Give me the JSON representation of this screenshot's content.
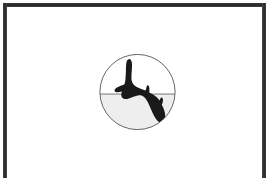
{
  "page": {
    "background_color": "#ffffff",
    "width": 269,
    "height": 178
  },
  "frame": {
    "name": "border-frame",
    "color": "#2e2e2e",
    "thickness_px": 4,
    "open_side": "bottom"
  },
  "emblem": {
    "name": "circular-bird-emblem",
    "shape": "circle",
    "outline_color": "#555555",
    "sky_color": "#ffffff",
    "ground_color": "#eeeeee",
    "horizon_color": "#666666",
    "bird_color": "#1a1a1a",
    "bird_subject": "raptor-in-flight",
    "center_x": 137,
    "center_y": 92,
    "radius": 38,
    "horizon_offset_from_top": 43,
    "alt_text": "Circular emblem: black bird of prey in flight over a horizon line, lower half shaded light gray"
  }
}
